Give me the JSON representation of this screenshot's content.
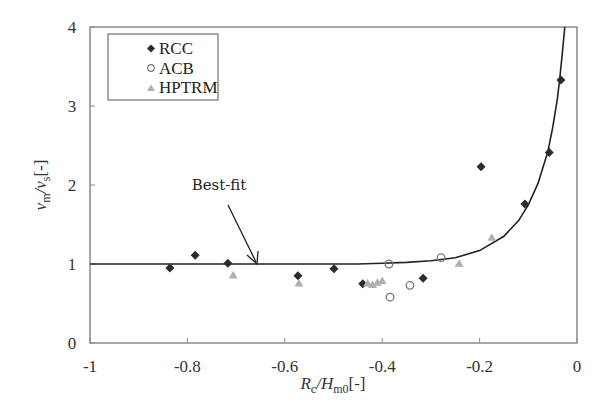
{
  "chart_data": {
    "type": "scatter",
    "title": "",
    "xlabel": "Rc/Hm0[-]",
    "ylabel": "vm/vs[-]",
    "xlim": [
      -1,
      0
    ],
    "ylim": [
      0,
      4
    ],
    "x_ticks": [
      -1,
      -0.8,
      -0.6,
      -0.4,
      -0.2,
      0
    ],
    "x_tick_labels": [
      "-1",
      "-0.8",
      "-0.6",
      "-0.4",
      "-0.2",
      "0"
    ],
    "y_ticks": [
      0,
      1,
      2,
      3,
      4
    ],
    "y_tick_labels": [
      "0",
      "1",
      "2",
      "3",
      "4"
    ],
    "grid": false,
    "legend_position": "upper-left",
    "series": [
      {
        "name": "RCC",
        "marker": "diamond",
        "color": "#2b2b2b",
        "points": [
          [
            -0.836,
            0.95
          ],
          [
            -0.784,
            1.11
          ],
          [
            -0.717,
            1.01
          ],
          [
            -0.573,
            0.85
          ],
          [
            -0.499,
            0.94
          ],
          [
            -0.44,
            0.75
          ],
          [
            -0.316,
            0.82
          ],
          [
            -0.197,
            2.23
          ],
          [
            -0.107,
            1.76
          ],
          [
            -0.057,
            2.41
          ],
          [
            -0.033,
            3.33
          ]
        ]
      },
      {
        "name": "ACB",
        "marker": "open-circle",
        "color": "#777777",
        "points": [
          [
            -0.386,
            1.0
          ],
          [
            -0.384,
            0.58
          ],
          [
            -0.343,
            0.73
          ],
          [
            -0.279,
            1.08
          ]
        ]
      },
      {
        "name": "HPTRM",
        "marker": "triangle",
        "color": "#b0b0b0",
        "points": [
          [
            -0.706,
            0.86
          ],
          [
            -0.571,
            0.76
          ],
          [
            -0.43,
            0.76
          ],
          [
            -0.42,
            0.74
          ],
          [
            -0.41,
            0.77
          ],
          [
            -0.4,
            0.79
          ],
          [
            -0.242,
            1.01
          ],
          [
            -0.175,
            1.34
          ]
        ]
      }
    ],
    "fit_curve": {
      "name": "Best-fit",
      "color": "#222222",
      "x": [
        -1,
        -0.6,
        -0.45,
        -0.4,
        -0.35,
        -0.3,
        -0.25,
        -0.2,
        -0.15,
        -0.12,
        -0.1,
        -0.08,
        -0.06,
        -0.05,
        -0.04,
        -0.035,
        -0.03,
        -0.025
      ],
      "y": [
        1.0,
        1.0,
        1.0,
        1.01,
        1.02,
        1.04,
        1.08,
        1.17,
        1.35,
        1.55,
        1.75,
        2.02,
        2.42,
        2.72,
        3.1,
        3.38,
        3.68,
        4.0
      ]
    },
    "annotations": [
      {
        "text": "Best-fit",
        "points_to": [
          -0.655,
          1.0
        ]
      }
    ]
  },
  "legend": {
    "items": [
      {
        "label": "RCC"
      },
      {
        "label": "ACB"
      },
      {
        "label": "HPTRM"
      }
    ]
  },
  "axes": {
    "x_label_main": "R",
    "x_label_sub1": "c",
    "x_label_mid": "/H",
    "x_label_sub2": "m0",
    "x_label_end": "[-]",
    "y_label_main": "v",
    "y_label_sub1": "m",
    "y_label_mid": "/v",
    "y_label_sub2": "s",
    "y_label_end": "[-]"
  },
  "annotation_label": "Best-fit"
}
